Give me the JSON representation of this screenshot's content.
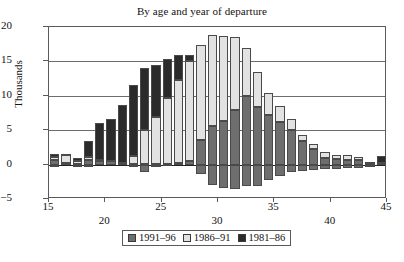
{
  "chart_data": {
    "type": "bar",
    "stacked": true,
    "title": "By age and year of departure",
    "xlabel": "",
    "ylabel": "Thousands",
    "ylim": [
      -5,
      20
    ],
    "xlim": [
      15,
      45
    ],
    "yticks": [
      20,
      15,
      10,
      5,
      0,
      -5
    ],
    "ytick_labels": [
      "20",
      "15",
      "10",
      "5",
      "0",
      "−5"
    ],
    "xticks": [
      15,
      20,
      25,
      30,
      35,
      40,
      45
    ],
    "xtick_labels": [
      "15",
      "20",
      "25",
      "30",
      "35",
      "40",
      "45"
    ],
    "xtick_rows": [
      0,
      1,
      0,
      1,
      0,
      1,
      0
    ],
    "grid": "horizontal",
    "legend_position": "bottom",
    "colors": {
      "1991-96": "#6e6e6e",
      "1986-91": "#e2e2e2",
      "1981-86": "#2b2b2b",
      "axis": "#5a5a5a",
      "gridline": "#6d6d6d",
      "background": "#ffffff",
      "text": "#111111"
    },
    "categories": [
      15,
      16,
      17,
      18,
      19,
      20,
      21,
      22,
      23,
      24,
      25,
      26,
      27,
      28,
      29,
      30,
      31,
      32,
      33,
      34,
      35,
      36,
      37,
      38,
      39,
      40,
      41,
      42,
      43,
      44
    ],
    "series": [
      {
        "name": "1991–96",
        "values": [
          0.6,
          0.2,
          0.1,
          0.7,
          0.5,
          0.5,
          0.2,
          0.1,
          0.1,
          0.1,
          0.1,
          0.2,
          0.5,
          3.6,
          5.6,
          6.3,
          8.0,
          10.0,
          8.4,
          7.2,
          6.2,
          5.0,
          3.4,
          2.3,
          0.9,
          0.8,
          0.7,
          0.6,
          0.3,
          0.2
        ]
      },
      {
        "name": "1986–91",
        "values": [
          0.5,
          1.3,
          0.4,
          0.4,
          0.1,
          0.0,
          0.1,
          1.2,
          4.9,
          6.8,
          9.6,
          12.1,
          14.6,
          13.8,
          13.2,
          12.4,
          10.5,
          7.0,
          5.1,
          3.2,
          2.3,
          1.6,
          0.9,
          0.7,
          1.0,
          0.6,
          0.7,
          0.5,
          0.1,
          0.1
        ]
      },
      {
        "name": "1981–86",
        "values": [
          0.5,
          0.1,
          0.4,
          2.3,
          5.4,
          6.2,
          8.4,
          10.3,
          9.1,
          7.6,
          5.7,
          3.6,
          0.9,
          0.0,
          0.0,
          0.0,
          0.0,
          0.0,
          0.0,
          0.0,
          0.0,
          0.0,
          0.0,
          0.0,
          0.0,
          0.0,
          0.0,
          0.0,
          0.0,
          0.9
        ]
      },
      {
        "name": "negative",
        "values": [
          -0.3,
          0.0,
          -0.2,
          -0.3,
          0.0,
          0.0,
          0.0,
          -0.1,
          -1.1,
          -0.2,
          0.0,
          0.0,
          0.0,
          -1.3,
          -2.9,
          -3.4,
          -3.5,
          -3.1,
          -3.1,
          -2.2,
          -1.7,
          -1.1,
          -0.9,
          -0.8,
          -0.7,
          -0.6,
          -0.5,
          -0.5,
          -0.3,
          0.0
        ]
      }
    ],
    "totals_positive": [
      1.6,
      1.6,
      0.9,
      3.4,
      6.0,
      6.7,
      8.7,
      11.6,
      14.1,
      14.5,
      15.4,
      15.9,
      16.0,
      17.4,
      18.8,
      18.7,
      18.5,
      17.0,
      13.5,
      10.4,
      8.5,
      6.6,
      4.3,
      3.0,
      1.9,
      1.4,
      1.4,
      1.1,
      0.4,
      1.2
    ]
  },
  "legend": {
    "items": [
      {
        "label": "1991–96",
        "color": "#6e6e6e"
      },
      {
        "label": "1986–91",
        "color": "#e2e2e2"
      },
      {
        "label": "1981–86",
        "color": "#2b2b2b"
      }
    ]
  }
}
